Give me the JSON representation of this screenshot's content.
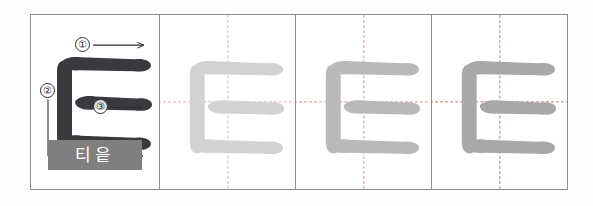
{
  "worksheet": {
    "title": "Hangul letter stroke-order practice sheet",
    "letter": "ㅌ",
    "letter_name": "티읕",
    "panel_count": 4
  },
  "model_panel": {
    "name": "model-panel",
    "glyph": "ㅌ",
    "glyph_color": "#3a3a3e",
    "label_chip": {
      "text": "티읕",
      "background": "#7f7f7f",
      "text_color": "#ffffff"
    },
    "stroke_order": [
      {
        "number": "①",
        "label": "1",
        "direction": "left-to-right",
        "arrow": "→"
      },
      {
        "number": "②",
        "label": "2",
        "direction": "down-then-right",
        "arrow": "→"
      },
      {
        "number": "③",
        "label": "3",
        "direction": "left-to-right",
        "arrow": "→"
      }
    ]
  },
  "trace_panels": [
    {
      "name": "trace-panel-1",
      "glyph": "ㅌ",
      "glyph_color": "#d2d2d4",
      "guide_color": "#c4786e"
    },
    {
      "name": "trace-panel-2",
      "glyph": "ㅌ",
      "glyph_color": "#b9b9bb",
      "guide_color": "#c4786e"
    },
    {
      "name": "trace-panel-3",
      "glyph": "ㅌ",
      "glyph_color": "#a8a8aa",
      "guide_color": "#c4786e"
    }
  ],
  "colors": {
    "frame_border": "#8d8d92",
    "page_background": "#ffffff",
    "guide_dash": "#c4786e",
    "model_stroke": "#3a3a3e",
    "annotation": "#2f2f33"
  }
}
